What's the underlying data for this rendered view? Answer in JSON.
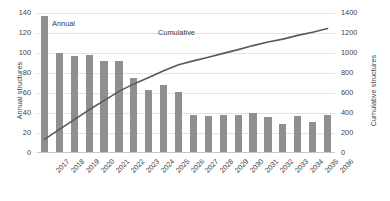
{
  "chart_data": {
    "type": "bar",
    "title": "",
    "xlabel": "",
    "ylabel": "Annual structures",
    "y2label": "Cumulative structures",
    "ylim": [
      0,
      140
    ],
    "y2lim": [
      0,
      1400
    ],
    "grid": true,
    "legend_position": "inline-annotation",
    "categories": [
      "2017",
      "2018",
      "2019",
      "2020",
      "2021",
      "2022",
      "2023",
      "2024",
      "2025",
      "2026",
      "2027",
      "2028",
      "2029",
      "2030",
      "2031",
      "2032",
      "2033",
      "2034",
      "2035",
      "2036"
    ],
    "series": [
      {
        "name": "Annual",
        "type": "bar",
        "axis": "left",
        "color": "#8f8f8f",
        "values": [
          137,
          100,
          97,
          98,
          92,
          92,
          75,
          63,
          68,
          61,
          38,
          37,
          38,
          38,
          40,
          36,
          29,
          37,
          31,
          38
        ]
      },
      {
        "name": "Cumulative",
        "type": "line",
        "axis": "right",
        "color": "#595959",
        "values": [
          137,
          237,
          334,
          432,
          524,
          616,
          691,
          754,
          822,
          883,
          921,
          958,
          996,
          1034,
          1074,
          1110,
          1139,
          1176,
          1207,
          1245
        ]
      }
    ],
    "y_ticks_left": [
      "0",
      "20",
      "40",
      "60",
      "80",
      "100",
      "120",
      "140"
    ],
    "y_ticks_right": [
      "0",
      "200",
      "400",
      "600",
      "800",
      "1000",
      "1200",
      "1400"
    ],
    "annotations": [
      {
        "name": "annual-label",
        "text": "Annual"
      },
      {
        "name": "cumulative-label",
        "text": "Cumulative"
      }
    ]
  },
  "colors": {
    "bar": "#8f8f8f",
    "line": "#595959",
    "grid": "#e3e3e3",
    "text": "#404040"
  }
}
